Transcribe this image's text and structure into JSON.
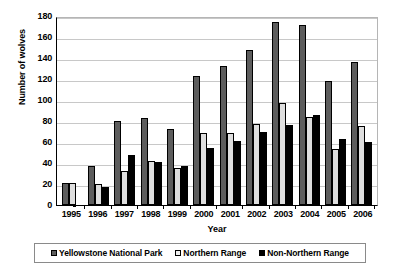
{
  "chart_data": {
    "type": "bar",
    "title": "",
    "xlabel": "Year",
    "ylabel": "Number of wolves",
    "categories": [
      "1995",
      "1996",
      "1997",
      "1998",
      "1999",
      "2000",
      "2001",
      "2002",
      "2003",
      "2004",
      "2005",
      "2006"
    ],
    "ylim": [
      0,
      180
    ],
    "yticks": [
      0,
      20,
      40,
      60,
      80,
      100,
      120,
      140,
      160,
      180
    ],
    "grid": true,
    "legend_position": "bottom",
    "series": [
      {
        "name": "Yellowstone National Park",
        "color": "#5d5d5d",
        "values": [
          21,
          37,
          80,
          83,
          72,
          123,
          132,
          148,
          174,
          171,
          118,
          136
        ]
      },
      {
        "name": "Northern Range",
        "color": "#dedede",
        "values": [
          21,
          20,
          32,
          42,
          35,
          69,
          69,
          77,
          97,
          84,
          53,
          75
        ]
      },
      {
        "name": "Non-Northern Range",
        "color": "#000000",
        "values": [
          null,
          17,
          48,
          41,
          37,
          54,
          61,
          70,
          76,
          86,
          63,
          60
        ]
      }
    ]
  },
  "axis": {
    "y_title": "Number of wolves",
    "x_title": "Year"
  },
  "legend": {
    "items": [
      {
        "label": "Yellowstone National Park",
        "swatch": "dark-gray-swatch"
      },
      {
        "label": "Northern Range",
        "swatch": "light-gray-swatch"
      },
      {
        "label": "Non-Northern Range",
        "swatch": "black-swatch"
      }
    ]
  }
}
